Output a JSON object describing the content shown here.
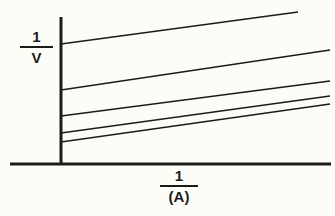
{
  "figure": {
    "background_color": "#fdfdf7",
    "ink_color": "#1b1b1b"
  },
  "axes": {
    "y_axis": {
      "name": "y-axis",
      "label_numerator": "1",
      "label_denominator": "V",
      "label_text": "1/V",
      "x_px": 61,
      "y_top_px": 17,
      "y_bottom_px": 164,
      "line_width_px": 3
    },
    "x_axis": {
      "name": "x-axis",
      "label_numerator": "1",
      "label_denominator": "(A)",
      "label_text": "1/(A)",
      "y_px": 164,
      "x_left_px": 10,
      "x_right_px": 331,
      "line_width_px": 3
    }
  },
  "chart_data": {
    "type": "line",
    "title": "",
    "subtitle": "",
    "xlabel": "1/(A)",
    "ylabel": "1/V",
    "grid": false,
    "legend": "none",
    "annotations": [],
    "xlim": [
      0,
      1
    ],
    "ylim": [
      0,
      1
    ],
    "xtick_labels": [],
    "ytick_labels": [],
    "note": "Five straight lines of positive slope with differing y-intercepts; drawn in pixel coordinates of the source figure (origin at axis corner x=61, y=164).",
    "series": [
      {
        "name": "line-1",
        "x": [
          61,
          298
        ],
        "y": [
          44,
          12
        ],
        "y_intercept_px": 44,
        "slope_px": -0.135
      },
      {
        "name": "line-2",
        "x": [
          61,
          330
        ],
        "y": [
          90,
          50
        ],
        "y_intercept_px": 90,
        "slope_px": -0.149
      },
      {
        "name": "line-3",
        "x": [
          61,
          330
        ],
        "y": [
          116,
          81
        ],
        "y_intercept_px": 116,
        "slope_px": -0.13
      },
      {
        "name": "line-4",
        "x": [
          61,
          330
        ],
        "y": [
          133,
          96
        ],
        "y_intercept_px": 133,
        "slope_px": -0.138
      },
      {
        "name": "line-5",
        "x": [
          61,
          330
        ],
        "y": [
          142,
          104
        ],
        "y_intercept_px": 142,
        "slope_px": -0.141
      }
    ]
  }
}
